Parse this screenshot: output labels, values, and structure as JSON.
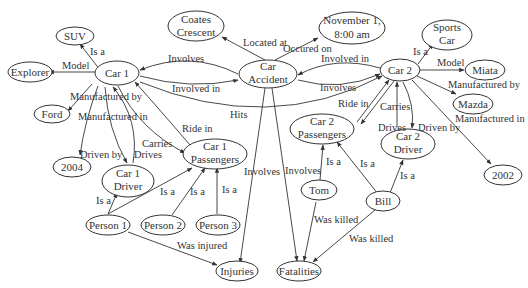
{
  "diagram": {
    "nodes": {
      "suv": "SUV",
      "explorer": "Explorer",
      "car1": "Car 1",
      "ford": "Ford",
      "y2004": "2004",
      "car1_driver_l1": "Car 1",
      "car1_driver_l2": "Driver",
      "car1_pass_l1": "Car 1",
      "car1_pass_l2": "Passengers",
      "person1": "Person 1",
      "person2": "Person 2",
      "person3": "Person 3",
      "injuries": "Injuries",
      "coates_l1": "Coates",
      "coates_l2": "Crescent",
      "accident_l1": "Car",
      "accident_l2": "Accident",
      "nov_l1": "November 1,",
      "nov_l2": "8:00 am",
      "car2": "Car 2",
      "sports_l1": "Sports",
      "sports_l2": "Car",
      "miata": "Miata",
      "mazda": "Mazda",
      "y2002": "2002",
      "car2_pass_l1": "Car 2",
      "car2_pass_l2": "Passengers",
      "car2_driver_l1": "Car 2",
      "car2_driver_l2": "Driver",
      "tom": "Tom",
      "bill": "Bill",
      "fatalities": "Fatalities"
    },
    "edge_labels": {
      "car1_isa": "Is a",
      "car1_model": "Model",
      "car1_manuf_by": "Manufactured by",
      "car1_manuf_in": "Manufactured in",
      "car1_driven_by": "Driven by",
      "car1_carries": "Carries",
      "car1_drives": "Drives",
      "car1_ride_in": "Ride in",
      "acc_involves_car1": "Involves",
      "car1_involved_in": "Involved in",
      "hits": "Hits",
      "located_at": "Located at",
      "occured_on": "Occured on",
      "car2_involved_in": "Involved in",
      "acc_involves_car2": "Involves",
      "car2_isa": "Is a",
      "car2_model": "Model",
      "car2_manuf_by": "Manufactured by",
      "car2_manuf_in": "Manufactured in",
      "car2_ride_in": "Ride in",
      "car2_carries": "Carries",
      "car2_drives": "Drives",
      "car2_driven_by": "Driven by",
      "acc_involves_inj": "Involves",
      "acc_involves_fat": "Involves",
      "p1_isa_driver": "Is a",
      "p1_isa_pass": "Is a",
      "p2_isa": "Is a",
      "p3_isa": "Is a",
      "was_injured": "Was injured",
      "tom_isa": "Is a",
      "bill_isa_pass": "Is a",
      "bill_isa_driver": "Is a",
      "tom_killed": "Was killed",
      "bill_killed": "Was killed"
    }
  }
}
